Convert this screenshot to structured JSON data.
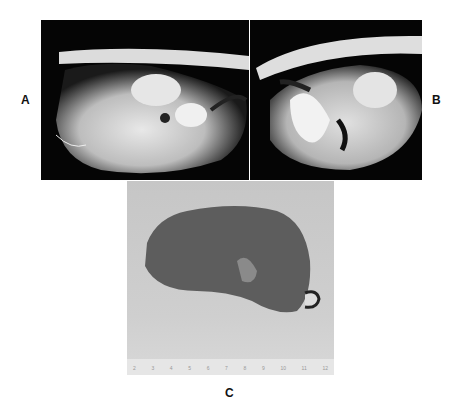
{
  "figure": {
    "panels": [
      {
        "id": "A",
        "label": "A",
        "content": "lateral abdominal radiograph"
      },
      {
        "id": "B",
        "label": "B",
        "content": "lateral abdominal radiograph"
      },
      {
        "id": "C",
        "label": "C",
        "content": "photograph of excised specimen with ruler"
      }
    ],
    "ruler_ticks": [
      "2",
      "3",
      "4",
      "5",
      "6",
      "7",
      "8",
      "9",
      "10",
      "11",
      "12"
    ]
  }
}
